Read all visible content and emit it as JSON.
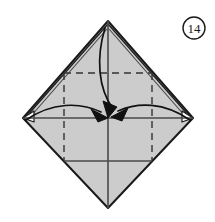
{
  "figure": {
    "kind": "origami-fold-diagram",
    "step_label": "14",
    "caption": "",
    "canvas": {
      "width": 215,
      "height": 222,
      "background": "#ffffff"
    },
    "colors": {
      "paper_fill": "#cccccc",
      "paper_fill_light": "#d6d6d6",
      "outline": "#1a1a1a",
      "crease_solid": "#4a4a4a",
      "crease_dashed": "#333333",
      "arrow": "#111111",
      "badge_stroke": "#1a1a1a",
      "badge_fill": "#ffffff"
    },
    "shape": {
      "name": "diamond",
      "top": {
        "x": 108,
        "y": 21
      },
      "right": {
        "x": 193,
        "y": 118
      },
      "bottom": {
        "x": 108,
        "y": 208
      },
      "left": {
        "x": 23,
        "y": 118
      },
      "center": {
        "x": 108,
        "y": 118
      }
    },
    "dashed_square": {
      "x": 64,
      "y": 73,
      "width": 88,
      "height": 88
    },
    "creases": [
      {
        "name": "vertical-center-crease",
        "style": "solid"
      },
      {
        "name": "horizontal-center-crease",
        "style": "solid"
      },
      {
        "name": "square-top-edge",
        "style": "dashed"
      },
      {
        "name": "square-left-edge",
        "style": "dashed"
      },
      {
        "name": "square-right-edge",
        "style": "dashed"
      },
      {
        "name": "square-bottom-edge",
        "style": "solid"
      }
    ],
    "arrows": [
      {
        "name": "fold-arrow-top",
        "from": "top-apex",
        "to": "center",
        "head": "solid"
      },
      {
        "name": "fold-arrow-left",
        "from": "left-point",
        "to": "center",
        "head": "solid"
      },
      {
        "name": "fold-arrow-right",
        "from": "right-point",
        "to": "center",
        "head": "solid"
      }
    ],
    "step_badge": {
      "cx": 194,
      "cy": 28,
      "r": 11
    }
  }
}
